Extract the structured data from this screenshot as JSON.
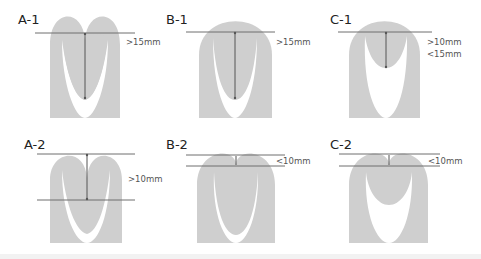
{
  "colors": {
    "shape_fill": "#cfcfcf",
    "line": "#6e6e6e",
    "arrow": "#555555",
    "background": "#ffffff"
  },
  "panels": [
    {
      "id": "A-1",
      "label": "A-1",
      "measure": [
        ">15mm"
      ]
    },
    {
      "id": "B-1",
      "label": "B-1",
      "measure": [
        ">15mm"
      ]
    },
    {
      "id": "C-1",
      "label": "C-1",
      "measure": [
        ">10mm",
        "<15mm"
      ]
    },
    {
      "id": "A-2",
      "label": "A-2",
      "measure": [
        ">10mm"
      ]
    },
    {
      "id": "B-2",
      "label": "B-2",
      "measure": [
        "<10mm"
      ]
    },
    {
      "id": "C-2",
      "label": "C-2",
      "measure": [
        "<10mm"
      ]
    }
  ]
}
